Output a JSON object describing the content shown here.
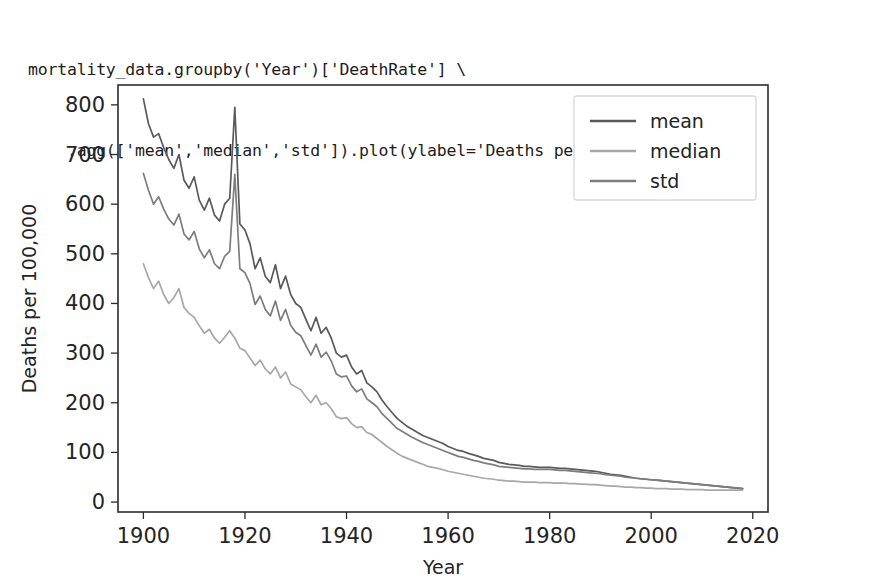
{
  "code": {
    "line1": "mortality_data.groupby('Year')['DeathRate'] \\",
    "line2": "    .agg(['mean','median','std']).plot(ylabel='Deaths per 100,000')"
  },
  "chart_data": {
    "type": "line",
    "title": "",
    "xlabel": "Year",
    "ylabel": "Deaths per 100,000",
    "xlim": [
      1895,
      2023
    ],
    "ylim": [
      -20,
      840
    ],
    "xticks": [
      1900,
      1920,
      1940,
      1960,
      1980,
      2000,
      2020
    ],
    "yticks": [
      0,
      100,
      200,
      300,
      400,
      500,
      600,
      700,
      800
    ],
    "grid": false,
    "legend_position": "upper right",
    "colors": {
      "mean": "#5a5a5a",
      "median": "#a8a8a8",
      "std": "#7d7d7d"
    },
    "x": [
      1900,
      1901,
      1902,
      1903,
      1904,
      1905,
      1906,
      1907,
      1908,
      1909,
      1910,
      1911,
      1912,
      1913,
      1914,
      1915,
      1916,
      1917,
      1918,
      1919,
      1920,
      1921,
      1922,
      1923,
      1924,
      1925,
      1926,
      1927,
      1928,
      1929,
      1930,
      1931,
      1932,
      1933,
      1934,
      1935,
      1936,
      1937,
      1938,
      1939,
      1940,
      1941,
      1942,
      1943,
      1944,
      1945,
      1946,
      1947,
      1948,
      1949,
      1950,
      1951,
      1952,
      1953,
      1954,
      1955,
      1956,
      1957,
      1958,
      1959,
      1960,
      1961,
      1962,
      1963,
      1964,
      1965,
      1966,
      1967,
      1968,
      1969,
      1970,
      1971,
      1972,
      1973,
      1974,
      1975,
      1976,
      1977,
      1978,
      1979,
      1980,
      1981,
      1982,
      1983,
      1984,
      1985,
      1986,
      1987,
      1988,
      1989,
      1990,
      1991,
      1992,
      1993,
      1994,
      1995,
      1996,
      1997,
      1998,
      1999,
      2000,
      2001,
      2002,
      2003,
      2004,
      2005,
      2006,
      2007,
      2008,
      2009,
      2010,
      2011,
      2012,
      2013,
      2014,
      2015,
      2016,
      2017,
      2018
    ],
    "series": [
      {
        "name": "mean",
        "values": [
          812,
          762,
          735,
          742,
          714,
          690,
          672,
          700,
          648,
          632,
          655,
          608,
          588,
          612,
          578,
          566,
          600,
          612,
          795,
          560,
          548,
          520,
          470,
          492,
          455,
          442,
          478,
          430,
          455,
          418,
          400,
          392,
          368,
          345,
          372,
          340,
          352,
          330,
          300,
          292,
          296,
          272,
          258,
          265,
          240,
          232,
          222,
          205,
          192,
          180,
          168,
          160,
          152,
          146,
          140,
          134,
          130,
          126,
          122,
          118,
          112,
          108,
          104,
          102,
          98,
          95,
          92,
          88,
          86,
          84,
          80,
          78,
          76,
          75,
          74,
          72,
          72,
          71,
          70,
          70,
          70,
          69,
          68,
          68,
          67,
          66,
          65,
          64,
          63,
          62,
          60,
          58,
          56,
          55,
          54,
          52,
          50,
          48,
          47,
          46,
          45,
          44,
          43,
          42,
          41,
          40,
          39,
          38,
          37,
          36,
          35,
          34,
          33,
          32,
          31,
          30,
          29,
          28,
          27
        ]
      },
      {
        "name": "median",
        "values": [
          480,
          452,
          430,
          445,
          418,
          400,
          412,
          430,
          392,
          380,
          372,
          355,
          340,
          348,
          330,
          320,
          332,
          345,
          330,
          310,
          305,
          290,
          275,
          286,
          268,
          258,
          272,
          250,
          262,
          238,
          232,
          226,
          212,
          200,
          215,
          196,
          200,
          188,
          172,
          168,
          170,
          158,
          150,
          152,
          140,
          136,
          128,
          120,
          112,
          105,
          98,
          92,
          88,
          84,
          80,
          76,
          72,
          70,
          68,
          65,
          62,
          60,
          58,
          56,
          54,
          52,
          50,
          48,
          47,
          46,
          44,
          43,
          42,
          42,
          41,
          40,
          40,
          40,
          39,
          39,
          39,
          38,
          38,
          38,
          37,
          37,
          36,
          36,
          35,
          35,
          34,
          33,
          32,
          32,
          31,
          30,
          30,
          29,
          29,
          28,
          28,
          27,
          27,
          27,
          26,
          26,
          26,
          25,
          25,
          25,
          25,
          24,
          24,
          24,
          24,
          24,
          24,
          24,
          24
        ]
      },
      {
        "name": "std",
        "values": [
          662,
          628,
          600,
          615,
          590,
          570,
          558,
          580,
          540,
          528,
          545,
          510,
          492,
          508,
          480,
          470,
          495,
          505,
          660,
          470,
          462,
          440,
          398,
          415,
          388,
          375,
          405,
          366,
          388,
          356,
          342,
          335,
          315,
          296,
          318,
          292,
          302,
          284,
          258,
          252,
          254,
          234,
          222,
          228,
          208,
          200,
          192,
          178,
          168,
          158,
          148,
          142,
          136,
          130,
          125,
          120,
          116,
          112,
          108,
          104,
          100,
          96,
          92,
          90,
          87,
          84,
          82,
          79,
          77,
          75,
          72,
          71,
          70,
          69,
          68,
          67,
          67,
          66,
          66,
          66,
          66,
          65,
          64,
          64,
          63,
          62,
          61,
          60,
          59,
          58,
          57,
          55,
          54,
          53,
          52,
          50,
          49,
          48,
          47,
          46,
          45,
          44,
          43,
          42,
          41,
          40,
          39,
          38,
          37,
          36,
          35,
          34,
          33,
          32,
          31,
          30,
          29,
          28,
          27
        ]
      }
    ],
    "legend": [
      {
        "label": "mean",
        "color": "#5a5a5a"
      },
      {
        "label": "median",
        "color": "#a8a8a8"
      },
      {
        "label": "std",
        "color": "#7d7d7d"
      }
    ]
  }
}
